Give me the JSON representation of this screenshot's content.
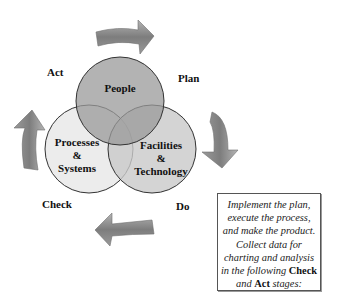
{
  "diagram": {
    "type": "pdca-venn-cycle",
    "circles": [
      {
        "label_lines": [
          "People"
        ],
        "fill": "#a9a9a9"
      },
      {
        "label_lines": [
          "Processes",
          "&",
          "Systems"
        ],
        "fill": "#e8e8e8"
      },
      {
        "label_lines": [
          "Facilities",
          "&",
          "Technology"
        ],
        "fill": "#cfcfcf"
      }
    ],
    "stages": {
      "act": "Act",
      "plan": "Plan",
      "do": "Do",
      "check": "Check"
    },
    "arrow_color": "#8a8a8a",
    "note": {
      "line1": "Implement the plan,",
      "line2": "execute the process,",
      "line3": "and make the product.",
      "line4": "Collect data for",
      "line5": "charting and analysis",
      "line6_prefix": "in the following ",
      "line6_bold": "Check",
      "line7_prefix": "and ",
      "line7_bold": "Act",
      "line7_suffix": " stages:"
    }
  }
}
